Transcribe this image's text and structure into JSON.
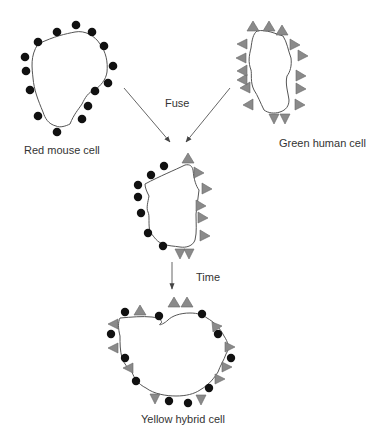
{
  "diagram": {
    "colors": {
      "membrane": "#555555",
      "mouse_protein": "#111111",
      "human_protein": "#8a8a8a",
      "arrow": "#555555",
      "text": "#333333"
    },
    "nodes": [
      {
        "id": "mouse",
        "label": "Red mouse cell",
        "marker": "black-circle"
      },
      {
        "id": "human",
        "label": "Green human cell",
        "marker": "gray-triangle"
      },
      {
        "id": "fused",
        "label": "",
        "marker": "mixed-segregated"
      },
      {
        "id": "hybrid",
        "label": "Yellow hybrid cell",
        "marker": "mixed-intermixed"
      }
    ],
    "edges": [
      {
        "from": "mouse",
        "to": "fused",
        "label": "Fuse"
      },
      {
        "from": "human",
        "to": "fused",
        "label": "Fuse"
      },
      {
        "from": "fused",
        "to": "hybrid",
        "label": "Time"
      }
    ],
    "labels": {
      "mouse": "Red mouse cell",
      "human": "Green human cell",
      "fuse": "Fuse",
      "time": "Time",
      "hybrid": "Yellow hybrid cell"
    }
  }
}
